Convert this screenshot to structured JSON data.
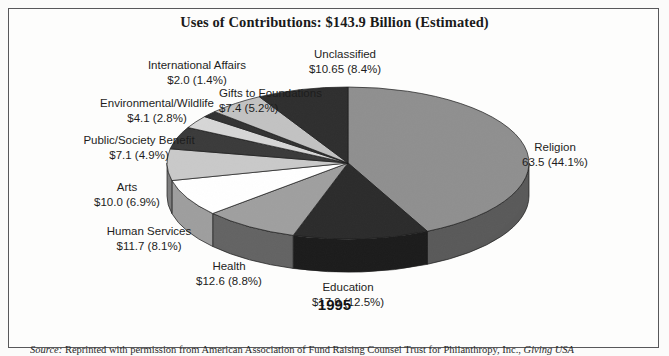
{
  "figure": {
    "title": "Uses of Contributions: $143.9 Billion (Estimated)",
    "year": "1995",
    "source_prefix": "Source:",
    "source_text": " Reprinted with permission from American Association of Fund Raising Counsel Trust for Philanthropy, Inc., ",
    "source_italic": "Giving USA"
  },
  "chart_data": {
    "type": "pie",
    "title": "Uses of Contributions: $143.9 Billion (Estimated)",
    "subtitle": "1995",
    "total_label": "$143.9 Billion (Estimated)",
    "total_value": 143.9,
    "units": "billions of US dollars",
    "legend": "labels-outside",
    "grid": false,
    "start_angle_deg": 0,
    "direction": "clockwise",
    "categories": [
      "Religion",
      "Education",
      "Health",
      "Human Services",
      "Arts",
      "Public/Society Benefit",
      "Environmental/Wildlife",
      "International Affairs",
      "Gifts to Foundations",
      "Unclassified"
    ],
    "values": [
      63.5,
      17.9,
      12.6,
      11.7,
      10.0,
      7.1,
      4.1,
      2.0,
      7.4,
      10.65
    ],
    "percents": [
      44.1,
      12.5,
      8.8,
      8.1,
      6.9,
      4.9,
      2.8,
      1.4,
      5.2,
      8.4
    ],
    "colors": [
      "#8f8f8f",
      "#2b2b2b",
      "#9f9f9f",
      "#ffffff",
      "#c9c9c9",
      "#3a3a3a",
      "#d6d6d6",
      "#333333",
      "#c2c2c2",
      "#2e2e2e"
    ],
    "slices": [
      {
        "name": "Religion",
        "value": 63.5,
        "percent": 44.1,
        "value_text": "63.5",
        "percent_text": "(44.1%)",
        "color": "#8f8f8f"
      },
      {
        "name": "Education",
        "value": 17.9,
        "percent": 12.5,
        "value_text": "$17.9",
        "percent_text": "(12.5%)",
        "color": "#2b2b2b"
      },
      {
        "name": "Health",
        "value": 12.6,
        "percent": 8.8,
        "value_text": "$12.6",
        "percent_text": "(8.8%)",
        "color": "#9f9f9f"
      },
      {
        "name": "Human Services",
        "value": 11.7,
        "percent": 8.1,
        "value_text": "$11.7",
        "percent_text": "(8.1%)",
        "color": "#ffffff"
      },
      {
        "name": "Arts",
        "value": 10.0,
        "percent": 6.9,
        "value_text": "$10.0",
        "percent_text": "(6.9%)",
        "color": "#c9c9c9"
      },
      {
        "name": "Public/Society Benefit",
        "value": 7.1,
        "percent": 4.9,
        "value_text": "$7.1",
        "percent_text": "(4.9%)",
        "color": "#3a3a3a"
      },
      {
        "name": "Environmental/Wildlife",
        "value": 4.1,
        "percent": 2.8,
        "value_text": "$4.1",
        "percent_text": "(2.8%)",
        "color": "#d6d6d6"
      },
      {
        "name": "International Affairs",
        "value": 2.0,
        "percent": 1.4,
        "value_text": "$2.0",
        "percent_text": "(1.4%)",
        "color": "#333333"
      },
      {
        "name": "Gifts to Foundations",
        "value": 7.4,
        "percent": 5.2,
        "value_text": "$7.4",
        "percent_text": "(5.2%)",
        "color": "#c2c2c2"
      },
      {
        "name": "Unclassified",
        "value": 10.65,
        "percent": 8.4,
        "value_text": "$10.65",
        "percent_text": "(8.4%)",
        "color": "#2e2e2e"
      }
    ]
  },
  "labels": {
    "religion": {
      "name": "Religion",
      "amount": "63.5 (44.1%)"
    },
    "education": {
      "name": "Education",
      "amount": "$17.9 (12.5%)"
    },
    "health": {
      "name": "Health",
      "amount": "$12.6 (8.8%)"
    },
    "human": {
      "name": "Human Services",
      "amount": "$11.7 (8.1%)"
    },
    "arts": {
      "name": "Arts",
      "amount": "$10.0 (6.9%)"
    },
    "public": {
      "name": "Public/Society Benefit",
      "amount": "$7.1 (4.9%)"
    },
    "environment": {
      "name": "Environmental/Wildlife",
      "amount": "$4.1 (2.8%)"
    },
    "international": {
      "name": "International Affairs",
      "amount": "$2.0 (1.4%)"
    },
    "gifts": {
      "name": "Gifts to Foundations",
      "amount": "$7.4 (5.2%)"
    },
    "unclassified": {
      "name": "Unclassified",
      "amount": "$10.65 (8.4%)"
    }
  }
}
